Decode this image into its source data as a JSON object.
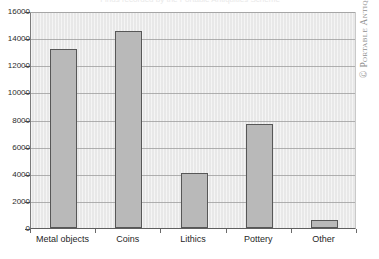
{
  "chart_data": {
    "type": "bar",
    "title": "Finds recorded by the Portable Antiquities Scheme",
    "xlabel": "",
    "ylabel": "",
    "categories": [
      "Metal objects",
      "Coins",
      "Lithics",
      "Pottery",
      "Other"
    ],
    "values": [
      13200,
      14550,
      4050,
      7650,
      620
    ],
    "ylim": [
      0,
      16000
    ],
    "yticks": [
      0,
      2000,
      4000,
      6000,
      8000,
      10000,
      12000,
      14000,
      16000
    ],
    "ytick_labels": [
      "0",
      "2000",
      "4000",
      "6000",
      "8000",
      "10000",
      "12000",
      "14000",
      "16000"
    ],
    "grid": "horizontal",
    "legend": "none",
    "bar_color": "#b9b9b9",
    "bar_edge_color": "#575757",
    "plot_background": "#e8e8e8"
  },
  "credit": {
    "text": "© Portable Antiquities Scheme"
  }
}
